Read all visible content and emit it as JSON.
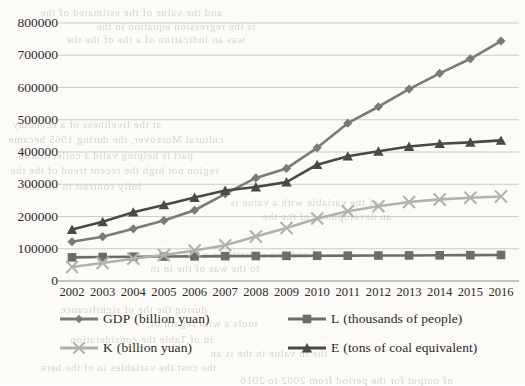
{
  "chart_data": {
    "type": "line",
    "title": "",
    "xlabel": "",
    "ylabel": "",
    "categories": [
      "2002",
      "2003",
      "2004",
      "2005",
      "2006",
      "2007",
      "2008",
      "2009",
      "2010",
      "2011",
      "2012",
      "2013",
      "2014",
      "2015",
      "2016"
    ],
    "ylim": [
      0,
      800000
    ],
    "ytick_step": 100000,
    "yticks": [
      "0",
      "100000",
      "200000",
      "300000",
      "400000",
      "500000",
      "600000",
      "700000",
      "800000"
    ],
    "grid": true,
    "legend_position": "bottom",
    "series": [
      {
        "name": "GDP",
        "unit": "billion yuan",
        "label": "GDP",
        "paren": "(billion yuan)",
        "marker": "diamond",
        "color": "#7c7a78",
        "values": [
          121717,
          137422,
          161840,
          187319,
          219439,
          270232,
          319516,
          349081,
          413030,
          489301,
          540367,
          595244,
          643974,
          689052,
          744127
        ]
      },
      {
        "name": "L",
        "unit": "thousands of people",
        "label": "L",
        "paren": "(thousands of people)",
        "marker": "square",
        "color": "#6e6c6a",
        "values": [
          73280,
          74432,
          75200,
          75825,
          76400,
          76990,
          77480,
          77995,
          78388,
          78579,
          78894,
          79300,
          79690,
          80091,
          80694
        ]
      },
      {
        "name": "K",
        "unit": "billion yuan",
        "label": "K",
        "paren": "(billion yuan)",
        "marker": "star",
        "color": "#b3b1ad",
        "values": [
          43500,
          55567,
          69168,
          80646,
          94402,
          110944,
          138325,
          164463,
          193604,
          216219,
          232000,
          245000,
          253000,
          258000,
          262000
        ]
      },
      {
        "name": "E",
        "unit": "tons of coal equivalent",
        "label": "E",
        "paren": "(tons of coal equivalent)",
        "marker": "triangle",
        "color": "#4a4846",
        "values": [
          159431,
          183792,
          213456,
          235997,
          258676,
          280508,
          291448,
          306647,
          360648,
          387043,
          402138,
          416913,
          425806,
          429905,
          436000
        ]
      }
    ]
  },
  "axis": {
    "y_max_label": "800000",
    "y_min_label": "0"
  },
  "bleed_text": [
    {
      "t": "and the value of the estimated of the",
      "x": 40,
      "y": 6
    },
    {
      "t": "is the regression equation in the",
      "x": 96,
      "y": 20
    },
    {
      "t": "was an indication of a the of the the",
      "x": 66,
      "y": 33
    },
    {
      "t": "at the liveliness of a economy",
      "x": 12,
      "y": 118
    },
    {
      "t": "cultural Moreover, the during 1965 became",
      "x": 8,
      "y": 133
    },
    {
      "t": "part is helping valid a collection in",
      "x": 18,
      "y": 149
    },
    {
      "t": "region not high the recent trend of the the",
      "x": 10,
      "y": 164
    },
    {
      "t": "fully contrast to the and",
      "x": 22,
      "y": 180
    },
    {
      "t": "of the variable with a value is",
      "x": 230,
      "y": 196
    },
    {
      "t": "an development of the the",
      "x": 262,
      "y": 210
    },
    {
      "t": "and to a constitutes a new",
      "x": 180,
      "y": 248
    },
    {
      "t": "to the was of the in in",
      "x": 150,
      "y": 262
    },
    {
      "t": "during the the of significance",
      "x": 60,
      "y": 303
    },
    {
      "t": "tools a with regard of",
      "x": 150,
      "y": 317
    },
    {
      "t": "in of Table the consideration",
      "x": 70,
      "y": 333
    },
    {
      "t": "the in value in the is an",
      "x": 210,
      "y": 347
    },
    {
      "t": "the cost the variables in of the here",
      "x": 40,
      "y": 361
    },
    {
      "t": "of output for the period from 2002 to 2016",
      "x": 240,
      "y": 374
    }
  ]
}
